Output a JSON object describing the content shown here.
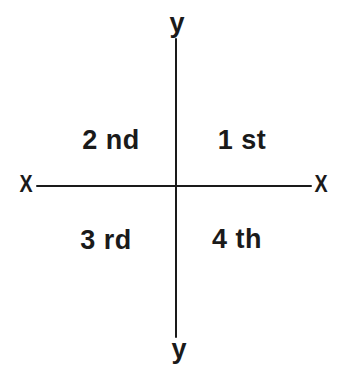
{
  "diagram": {
    "background": "#ffffff",
    "ink": "#1a1a1a",
    "axes": {
      "vertical": {
        "top_label": "y",
        "bottom_label": "y"
      },
      "horizontal": {
        "left_label": "X",
        "right_label": "X"
      }
    },
    "quadrants": [
      {
        "label": "1 st",
        "position": "upper-right"
      },
      {
        "label": "2 nd",
        "position": "upper-left"
      },
      {
        "label": "3 rd",
        "position": "lower-left"
      },
      {
        "label": "4 th",
        "position": "lower-right"
      }
    ]
  }
}
